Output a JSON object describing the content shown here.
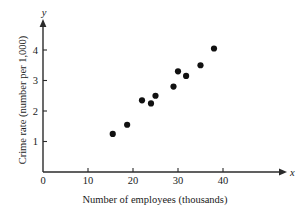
{
  "chart_data": {
    "type": "scatter",
    "title": "",
    "xlabel": "Number of employees (thousands)",
    "ylabel": "Crime rate (number per 1,000)",
    "x_var_symbol": "x",
    "y_var_symbol": "y",
    "xlim": [
      0,
      44
    ],
    "ylim": [
      0,
      4.6
    ],
    "xticks": [
      0,
      10,
      20,
      30,
      40
    ],
    "yticks": [
      1,
      2,
      3,
      4
    ],
    "xtick_labels": [
      "0",
      "10",
      "20",
      "30",
      "40"
    ],
    "ytick_labels": [
      "1",
      "2",
      "3",
      "4"
    ],
    "grid": false,
    "legend": null,
    "point_color": "#111111",
    "axis_color": "#2b2b2b",
    "points": [
      {
        "x": 15.5,
        "y": 1.25
      },
      {
        "x": 18.7,
        "y": 1.55
      },
      {
        "x": 22.0,
        "y": 2.35
      },
      {
        "x": 24.0,
        "y": 2.25
      },
      {
        "x": 25.0,
        "y": 2.5
      },
      {
        "x": 29.0,
        "y": 2.8
      },
      {
        "x": 30.0,
        "y": 3.3
      },
      {
        "x": 31.8,
        "y": 3.15
      },
      {
        "x": 35.0,
        "y": 3.5
      },
      {
        "x": 38.0,
        "y": 4.05
      }
    ]
  }
}
